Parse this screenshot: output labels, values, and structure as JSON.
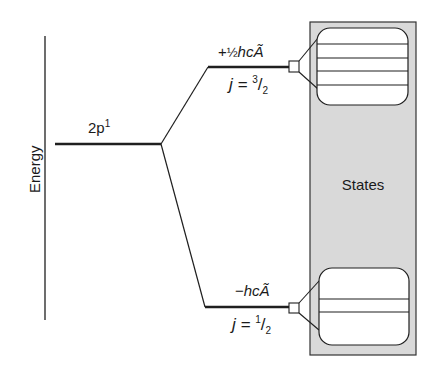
{
  "diagram": {
    "axis": {
      "label": "Energy"
    },
    "base_level": {
      "label": "2p",
      "superscript": "1"
    },
    "upper_level": {
      "energy_label_sign": "+",
      "energy_label_fraction": "½",
      "energy_label_term": "hcÃ",
      "j_label_prefix": "j = ",
      "j_num": "3",
      "j_slash": "/",
      "j_den": "2",
      "state_count": 4
    },
    "lower_level": {
      "energy_label_sign": "−",
      "energy_label_term": "hcÃ",
      "j_label_prefix": "j = ",
      "j_num": "1",
      "j_slash": "/",
      "j_den": "2",
      "state_count": 2
    },
    "states_panel": {
      "label": "States"
    },
    "colors": {
      "line": "#1f1f1f",
      "panel_fill": "#d9d9d9",
      "box_fill": "#ffffff"
    }
  }
}
